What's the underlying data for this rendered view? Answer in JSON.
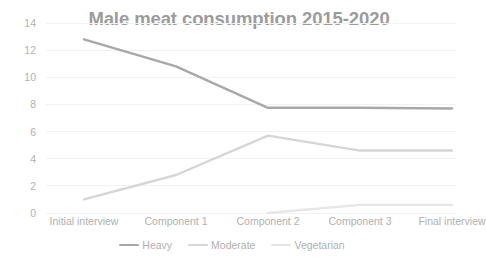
{
  "chart_data": {
    "type": "line",
    "title": "Male meat consumption 2015-2020",
    "xlabel": "",
    "ylabel": "",
    "ylim": [
      0,
      14
    ],
    "yticks": [
      0,
      2,
      4,
      6,
      8,
      10,
      12,
      14
    ],
    "grid": true,
    "legend_position": "bottom",
    "categories": [
      "Initial interview",
      "Component 1",
      "Component 2",
      "Component 3",
      "Final interview"
    ],
    "series": [
      {
        "name": "Heavy",
        "color": "#a8a8a8",
        "values": [
          12.8,
          10.8,
          7.75,
          7.75,
          7.7
        ]
      },
      {
        "name": "Moderate",
        "color": "#d6d6d6",
        "values": [
          1.0,
          2.8,
          5.7,
          4.6,
          4.6
        ]
      },
      {
        "name": "Vegetarian",
        "color": "#e6e6e6",
        "values": [
          null,
          null,
          0.0,
          0.6,
          0.6
        ]
      }
    ]
  },
  "styles": {
    "grid_color": "#f2f2f2",
    "tick_text_color": "#b0b0b0",
    "title_color": "#9b9b9b",
    "background": "#ffffff"
  }
}
